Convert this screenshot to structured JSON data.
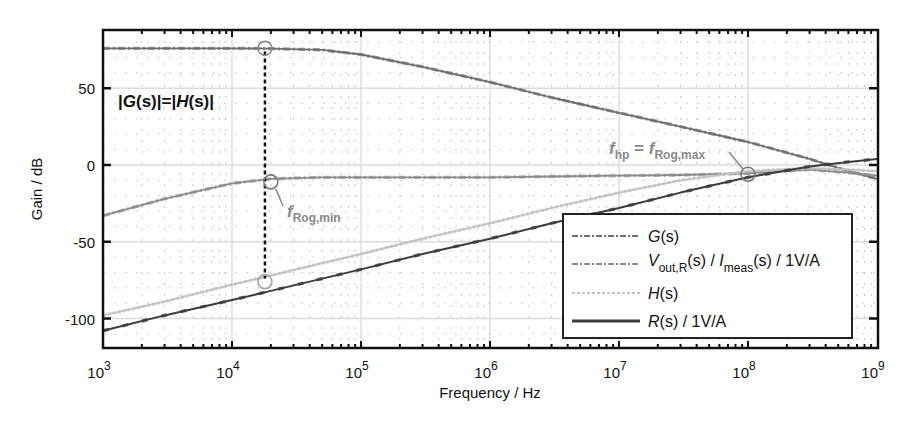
{
  "chart_data": {
    "type": "line",
    "title": "",
    "xlabel": "Frequency / Hz",
    "ylabel": "Gain / dB",
    "xscale": "log",
    "xlim": [
      1000,
      1000000000
    ],
    "ylim": [
      -118,
      88
    ],
    "grid": true,
    "x_ticks": [
      {
        "value": 1000,
        "base": "10",
        "exp": "3"
      },
      {
        "value": 10000,
        "base": "10",
        "exp": "4"
      },
      {
        "value": 100000,
        "base": "10",
        "exp": "5"
      },
      {
        "value": 1000000,
        "base": "10",
        "exp": "6"
      },
      {
        "value": 10000000,
        "base": "10",
        "exp": "7"
      },
      {
        "value": 100000000,
        "base": "10",
        "exp": "8"
      },
      {
        "value": 1000000000,
        "base": "10",
        "exp": "9"
      }
    ],
    "y_ticks": [
      50,
      0,
      -50,
      -100
    ],
    "y_tick_labels": [
      "50",
      "0",
      "-50",
      "-100"
    ],
    "legend_position": "lower right (inside)",
    "x": [
      1000,
      3000,
      10000,
      20000,
      50000,
      100000,
      300000,
      1000000,
      3000000,
      10000000,
      30000000,
      100000000,
      300000000,
      600000000,
      1000000000
    ],
    "series": [
      {
        "name": "G(s)",
        "color": "#6e6e6e",
        "style": "dashed-dot",
        "values": [
          76,
          76,
          76,
          75.8,
          75,
          72,
          64,
          54,
          44,
          34,
          25,
          15,
          4,
          -4,
          -9
        ]
      },
      {
        "name": "V_out,R(s) / I_meas(s) / 1V/A",
        "color": "#8c8c8c",
        "style": "dashed-dot",
        "values": [
          -33,
          -22,
          -12,
          -9,
          -8,
          -8,
          -8,
          -8,
          -7.5,
          -7,
          -6.5,
          -5.5,
          -3,
          -5,
          -7
        ]
      },
      {
        "name": "H(s)",
        "color": "#c2c2c2",
        "style": "dotted",
        "values": [
          -98,
          -89,
          -78,
          -72,
          -64,
          -58,
          -48,
          -38,
          -28,
          -18,
          -10,
          -4,
          -2,
          -3,
          -4
        ]
      },
      {
        "name": "R(s) / 1V/A",
        "color": "#3c3c3c",
        "style": "solid",
        "values": [
          -108,
          -98,
          -88,
          -82,
          -74,
          -68,
          -58,
          -48,
          -38,
          -28,
          -18,
          -8,
          -1,
          2,
          4
        ]
      }
    ],
    "annotations": [
      {
        "text": "|G(s)|=|H(s)|",
        "type": "vertical-dashed-line",
        "x": 18000,
        "y_from": 76,
        "y_to": -76
      },
      {
        "text": "f_Rog,min",
        "marker": "circle",
        "x": 20000,
        "y": -11
      },
      {
        "text": "f_hp = f_Rog,max",
        "marker": "circle",
        "x": 100000000,
        "y": -6
      },
      {
        "marker": "circle",
        "x": 18000,
        "y": 76
      },
      {
        "marker": "circle",
        "x": 18000,
        "y": -76
      }
    ]
  },
  "axes": {
    "xlabel": "Frequency / Hz",
    "ylabel": "Gain / dB"
  },
  "legend": {
    "items": [
      {
        "label_main": "G",
        "label_rest": "(s)",
        "color": "#6e6e6e"
      },
      {
        "label_main": "V",
        "label_sub": "out,R",
        "label_mid": "(s) / ",
        "label_main2": "I",
        "label_sub2": "meas",
        "label_rest": "(s) / 1V/A",
        "color": "#8c8c8c"
      },
      {
        "label_main": "H",
        "label_rest": "(s)",
        "color": "#c2c2c2"
      },
      {
        "label_main": "R",
        "label_rest": "(s) / 1V/A",
        "color": "#3c3c3c"
      }
    ]
  },
  "annotations": {
    "equality": {
      "bar1": "|",
      "G": "G",
      "s1": "(s)|=|",
      "H": "H",
      "s2": "(s)|"
    },
    "frog_min": {
      "f": "f",
      "sub": "Rog,min"
    },
    "fhp": {
      "f": "f",
      "sub": "hp",
      "eq": " = ",
      "f2": "f",
      "sub2": "Rog,max"
    }
  }
}
